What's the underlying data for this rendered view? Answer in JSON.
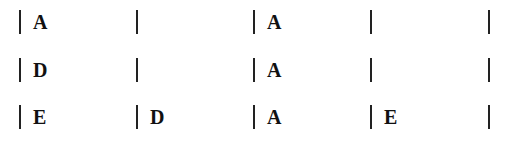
{
  "grid": {
    "rows": [
      [
        "A",
        "",
        "A",
        ""
      ],
      [
        "D",
        "",
        "A",
        ""
      ],
      [
        "E",
        "D",
        "A",
        "E"
      ]
    ]
  }
}
